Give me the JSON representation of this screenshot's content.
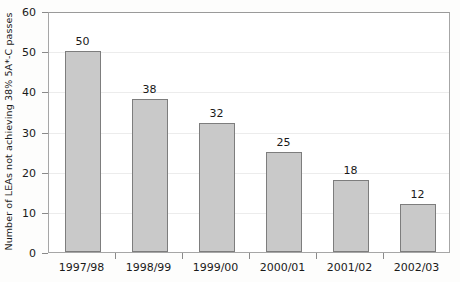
{
  "chart_data": {
    "type": "bar",
    "title": "",
    "subtitle": "",
    "xlabel": "",
    "ylabel": "Number of LEAs not achieving 38% 5A*-C passes",
    "categories": [
      "1997/98",
      "1998/99",
      "1999/00",
      "2000/01",
      "2001/02",
      "2002/03"
    ],
    "values": [
      50,
      38,
      32,
      25,
      18,
      12
    ],
    "data_labels": [
      "50",
      "38",
      "32",
      "25",
      "18",
      "12"
    ],
    "ylim": [
      0,
      60
    ],
    "ytick_labels": [
      "0",
      "10",
      "20",
      "30",
      "40",
      "50",
      "60"
    ],
    "ytick_values": [
      0,
      10,
      20,
      30,
      40,
      50,
      60
    ],
    "grid": "horizontal",
    "legend": "none",
    "series": [
      {
        "name": "LEAs not achieving 38% 5A*-C passes",
        "values": [
          50,
          38,
          32,
          25,
          18,
          12
        ]
      }
    ],
    "colors": {
      "bar_fill": "#c9c9c9",
      "bar_border": "#7d7d7d",
      "gridline": "#ececec",
      "axis": "#a6a6a6",
      "text": "#1a1a1a",
      "plot_background": "#ffffff",
      "figure_background": "#fdfdfc"
    }
  }
}
